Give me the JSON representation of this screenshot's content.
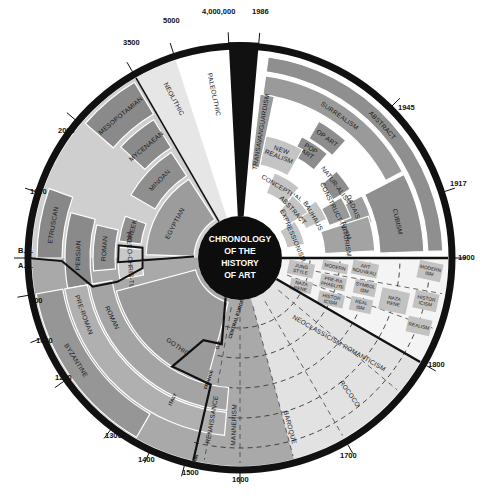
{
  "title": [
    "CHRONOLOGY",
    "OF THE",
    "HISTORY",
    "OF ART"
  ],
  "colors": {
    "ring": "#111111",
    "dark": "#8a8a8a",
    "mid": "#a8a8a8",
    "light": "#c8c8c8",
    "pale": "#dedede",
    "white": "#ffffff",
    "box": "#bdbdbd"
  },
  "geometry": {
    "cx": 240,
    "cy": 258,
    "r_outer": 216,
    "r_ring_inner": 208,
    "r_center": 42
  },
  "ticks": [
    {
      "label": "4,000,000",
      "angle": -3,
      "lx": 202,
      "ly": 14
    },
    {
      "label": "1986",
      "angle": 5,
      "lx": 252,
      "ly": 14
    },
    {
      "label": "5000",
      "angle": -18,
      "lx": 163,
      "ly": 23
    },
    {
      "label": "3500",
      "angle": -30,
      "lx": 123,
      "ly": 45
    },
    {
      "label": "2000",
      "angle": -50,
      "lx": 58,
      "ly": 133
    },
    {
      "label": "1000",
      "angle": -72,
      "lx": 30,
      "ly": 194
    },
    {
      "label": "B.C.",
      "angle": -90,
      "lx": 18,
      "ly": 253
    },
    {
      "label": "A.D.",
      "angle": -91,
      "lx": 18,
      "ly": 268
    },
    {
      "label": "500",
      "angle": -100,
      "lx": 30,
      "ly": 303
    },
    {
      "label": "1000",
      "angle": -112,
      "lx": 36,
      "ly": 343
    },
    {
      "label": "1200",
      "angle": -125,
      "lx": 55,
      "ly": 380
    },
    {
      "label": "1300",
      "angle": -143,
      "lx": 105,
      "ly": 438
    },
    {
      "label": "1400",
      "angle": -155,
      "lx": 138,
      "ly": 462
    },
    {
      "label": "1500",
      "angle": -165,
      "lx": 182,
      "ly": 475
    },
    {
      "label": "1600",
      "angle": 180,
      "lx": 232,
      "ly": 482
    },
    {
      "label": "1700",
      "angle": 150,
      "lx": 340,
      "ly": 458
    },
    {
      "label": "1800",
      "angle": 120,
      "lx": 428,
      "ly": 367
    },
    {
      "label": "1900",
      "angle": 90,
      "lx": 458,
      "ly": 260
    },
    {
      "label": "1917",
      "angle": 72,
      "lx": 450,
      "ly": 186
    },
    {
      "label": "1945",
      "angle": 45,
      "lx": 398,
      "ly": 110
    }
  ],
  "wedges": [
    {
      "name": "paleolithic-wedge",
      "a0": -18,
      "a1": -3,
      "r0": 42,
      "r1": 208,
      "fill": "#ffffff"
    },
    {
      "name": "neolithic-wedge",
      "a0": -30,
      "a1": -18,
      "r0": 42,
      "r1": 208,
      "fill": "#e6e6e6"
    },
    {
      "name": "modern-era-wedge",
      "a0": 5,
      "a1": 90,
      "r0": 42,
      "r1": 208,
      "fill": "#ffffff"
    },
    {
      "name": "nineteenth-century-wedge",
      "a0": 90,
      "a1": 120,
      "r0": 42,
      "r1": 208,
      "fill": "#f4f4f4"
    },
    {
      "name": "baroque-era-wedge",
      "a0": 120,
      "a1": 180,
      "r0": 42,
      "r1": 208,
      "fill": "#e2e2e2"
    },
    {
      "name": "renaissance-wedge",
      "a0": 180,
      "a1": 195,
      "r0": 42,
      "r1": 208,
      "fill": "#f6f6f6"
    },
    {
      "name": "ancient-wedge",
      "a0": -90,
      "a1": -30,
      "r0": 42,
      "r1": 208,
      "fill": "#cfcfcf"
    },
    {
      "name": "medieval-wedge",
      "a0": -195,
      "a1": -90,
      "r0": 42,
      "r1": 208,
      "fill": "#a9a9a9"
    },
    {
      "name": "black-divider-wedge",
      "a0": -3,
      "a1": 5,
      "r0": 42,
      "r1": 216,
      "fill": "#111111"
    }
  ],
  "bands": [
    {
      "name": "abstract-band",
      "a0": 8,
      "a1": 88,
      "r0": 188,
      "r1": 203,
      "fill": "#8f8f8f",
      "label": "ABSTRACT",
      "la": 47,
      "lr": 195,
      "size": 7
    },
    {
      "name": "surrealism-band",
      "a0": 8,
      "a1": 62,
      "r0": 165,
      "r1": 184,
      "fill": "#9a9a9a",
      "label": "SURREALISM",
      "la": 35,
      "lr": 174,
      "size": 7
    },
    {
      "name": "cubism-band",
      "a0": 63,
      "a1": 88,
      "r0": 140,
      "r1": 184,
      "fill": "#8f8f8f",
      "label": "CUBISM",
      "la": 77,
      "lr": 162,
      "size": 6.5
    },
    {
      "name": "dadaism-band",
      "a0": 63,
      "a1": 75,
      "r0": 110,
      "r1": 137,
      "fill": "#9d9d9d",
      "label": "DADAISM",
      "la": 67,
      "lr": 124,
      "size": 5.5
    },
    {
      "name": "futurism-band",
      "a0": 72,
      "a1": 87,
      "r0": 85,
      "r1": 135,
      "fill": "#a3a3a3",
      "label": "FUTURISM",
      "la": 80,
      "lr": 108,
      "size": 6
    },
    {
      "name": "op-art-band",
      "a0": 30,
      "a1": 42,
      "r0": 138,
      "r1": 158,
      "fill": "#8d8d8d",
      "label": "OP ART",
      "la": 36,
      "lr": 148,
      "size": 6
    },
    {
      "name": "pop-art-band",
      "a0": 27,
      "a1": 40,
      "r0": 115,
      "r1": 136,
      "fill": "#8d8d8d",
      "label": "POP ART",
      "la": 33,
      "lr": 125,
      "size": 6
    },
    {
      "name": "new-realism-band",
      "a0": 12,
      "a1": 30,
      "r0": 95,
      "r1": 125,
      "fill": "#c4c4c4",
      "label": "NEW REALISM",
      "la": 21,
      "lr": 110,
      "size": 6.5
    },
    {
      "name": "naturalism-band",
      "a0": 48,
      "a1": 58,
      "r0": 110,
      "r1": 130,
      "fill": "#8d8d8d",
      "label": "NATUR-ALISM",
      "la": 53,
      "lr": 120,
      "size": 4.5
    },
    {
      "name": "constructivism-band",
      "a0": 59,
      "a1": 70,
      "r0": 95,
      "r1": 118,
      "fill": "#999999",
      "label": "CONSTRUCT-IVISM",
      "la": 64,
      "lr": 106,
      "size": 4.5
    },
    {
      "name": "bauhaus-band",
      "a0": 53,
      "a1": 66,
      "r0": 72,
      "r1": 95,
      "fill": "#c4c4c4",
      "label": "BAUHAUS",
      "la": 60,
      "lr": 84,
      "size": 5
    },
    {
      "name": "conceptual-band",
      "a0": 22,
      "a1": 40,
      "r0": 70,
      "r1": 92,
      "fill": "#c4c4c4",
      "label": "CONCEPTUAL",
      "la": 31,
      "lr": 81,
      "size": 5
    },
    {
      "name": "abstract-inner-band",
      "a0": 40,
      "a1": 56,
      "r0": 60,
      "r1": 82,
      "fill": "#c4c4c4",
      "label": "ABSTRACT",
      "la": 48,
      "lr": 71,
      "size": 5
    },
    {
      "name": "expressionism-band",
      "a0": 56,
      "a1": 78,
      "r0": 48,
      "r1": 66,
      "fill": "#c4c4c4",
      "label": "EXPRESSIONISM",
      "la": 67,
      "lr": 57,
      "size": 4.8
    },
    {
      "name": "transavanguardism-band",
      "a0": 7,
      "a1": 12,
      "r0": 92,
      "r1": 165,
      "fill": "#9a9a9a",
      "label": "TRANSAVANGUARDISM",
      "la": 9.5,
      "lr": 128,
      "size": 5.5,
      "radial": true
    },
    {
      "name": "mesopotamian-band",
      "a0": -49,
      "a1": -31,
      "r0": 168,
      "r1": 205,
      "fill": "#8a8a8a",
      "label": "MESOPOTAMIAN",
      "la": -40,
      "lr": 186,
      "size": 6.5
    },
    {
      "name": "mycenaean-band",
      "a0": -47,
      "a1": -32,
      "r0": 130,
      "r1": 163,
      "fill": "#8a8a8a",
      "label": "MYCENAEAN",
      "la": -40,
      "lr": 146,
      "size": 6.5
    },
    {
      "name": "minoan-band",
      "a0": -60,
      "a1": -33,
      "r0": 98,
      "r1": 126,
      "fill": "#8f8f8f",
      "label": "MINOAN",
      "la": -46,
      "lr": 112,
      "size": 6.5
    },
    {
      "name": "egyptian-band",
      "a0": -88,
      "a1": -33,
      "r0": 46,
      "r1": 94,
      "fill": "#9c9c9c",
      "label": "EGYPTIAN",
      "la": -62,
      "lr": 74,
      "size": 7
    },
    {
      "name": "etruscan-band",
      "a0": -90,
      "a1": -70,
      "r0": 178,
      "r1": 203,
      "fill": "#888888",
      "label": "ETRUSCAN",
      "la": -80,
      "lr": 190,
      "size": 6.5
    },
    {
      "name": "persian-band",
      "a0": -100,
      "a1": -75,
      "r0": 150,
      "r1": 175,
      "fill": "#8a8a8a",
      "label": "PERSIAN",
      "la": -89,
      "lr": 162,
      "size": 6.5
    },
    {
      "name": "roman-ancient-band",
      "a0": -95,
      "a1": -77,
      "r0": 125,
      "r1": 147,
      "fill": "#8f8f8f",
      "label": "ROMAN",
      "la": -86,
      "lr": 136,
      "size": 6
    },
    {
      "name": "greek-band",
      "a0": -82,
      "a1": -70,
      "r0": 100,
      "r1": 122,
      "fill": "#8f8f8f",
      "label": "GREEK",
      "la": -76,
      "lr": 111,
      "size": 5.5
    },
    {
      "name": "paleo-christian-band",
      "a0": -100,
      "a1": -85,
      "r0": 98,
      "r1": 122,
      "fill": "#c9c9c9",
      "label": "PALEO-CHRIS-TIAN",
      "la": -93,
      "lr": 110,
      "size": 5.5
    },
    {
      "name": "byzantine-band",
      "a0": -150,
      "a1": -100,
      "r0": 180,
      "r1": 207,
      "fill": "#969696",
      "label": "BYZANTINE",
      "la": -122,
      "lr": 193,
      "size": 7
    },
    {
      "name": "pre-roman-band",
      "a0": -175,
      "a1": -100,
      "r0": 155,
      "r1": 178,
      "fill": "#b0b0b0",
      "label": "PRE-ROMAN",
      "la": -110,
      "lr": 166,
      "size": 6.5
    },
    {
      "name": "roman-medieval-band",
      "a0": -175,
      "a1": -100,
      "r0": 130,
      "r1": 153,
      "fill": "#a4a4a4",
      "label": "ROMAN",
      "la": -115,
      "lr": 141,
      "size": 6.5
    },
    {
      "name": "gothic-band",
      "a0": -165,
      "a1": -105,
      "r0": 46,
      "r1": 128,
      "fill": "#9a9a9a",
      "label": "GOTHIC",
      "la": -145,
      "lr": 108,
      "size": 7
    }
  ],
  "medieval_sublabels": [
    {
      "label": "CENTRAL EUROPE",
      "x": 238,
      "y": 318,
      "rot": -72
    },
    {
      "label": "G.B.",
      "x": 220,
      "y": 345,
      "rot": -72
    },
    {
      "label": "FRANCE",
      "x": 210,
      "y": 380,
      "rot": -72
    },
    {
      "label": "ITALY",
      "x": 174,
      "y": 400,
      "rot": -65
    },
    {
      "label": "SPAIN",
      "x": 196,
      "y": 462,
      "rot": -72
    }
  ],
  "nineteenth_boxes": [
    {
      "label": "JUNG STYLE",
      "x": 288,
      "y": 262,
      "w": 26,
      "h": 14
    },
    {
      "label": "MODERN",
      "x": 322,
      "y": 262,
      "w": 26,
      "h": 10
    },
    {
      "label": "ART NOUVEAU",
      "x": 352,
      "y": 262,
      "w": 26,
      "h": 14
    },
    {
      "label": "NAZA RENE",
      "x": 290,
      "y": 280,
      "w": 22,
      "h": 12
    },
    {
      "label": "PRE-RA PHAELITE",
      "x": 320,
      "y": 276,
      "w": 26,
      "h": 13
    },
    {
      "label": "SYMBOL ISM",
      "x": 354,
      "y": 281,
      "w": 22,
      "h": 14
    },
    {
      "label": "HISTOR ICISM",
      "x": 318,
      "y": 293,
      "w": 26,
      "h": 13
    },
    {
      "label": "REAL ISM",
      "x": 350,
      "y": 298,
      "w": 22,
      "h": 14
    },
    {
      "label": "NAZA RENE",
      "x": 380,
      "y": 290,
      "w": 28,
      "h": 22
    },
    {
      "label": "MODERN ISM",
      "x": 418,
      "y": 262,
      "w": 24,
      "h": 18
    },
    {
      "label": "HISTOR ICISM",
      "x": 414,
      "y": 292,
      "w": 24,
      "h": 18
    },
    {
      "label": "REALISM",
      "x": 407,
      "y": 318,
      "w": 24,
      "h": 16
    }
  ],
  "baroque_labels": [
    {
      "label": "NEOCLASSICISM ROMANTICISM",
      "x": 338,
      "y": 345,
      "rot": 30,
      "size": 7
    },
    {
      "label": "ROCOCO",
      "x": 348,
      "y": 395,
      "rot": 55,
      "size": 6.5
    },
    {
      "label": "BAROQUE",
      "x": 288,
      "y": 428,
      "rot": 75,
      "size": 6.5
    },
    {
      "label": "MANNERISM",
      "x": 236,
      "y": 425,
      "rot": -88,
      "size": 6.5
    },
    {
      "label": "RENAISSANCE",
      "x": 214,
      "y": 420,
      "rot": -80,
      "size": 6.5
    }
  ],
  "prehistoric_labels": [
    {
      "label": "PALEOLITHIC",
      "x": 212,
      "y": 95,
      "rot": 78,
      "size": 6.5
    },
    {
      "label": "NEOLITHIC",
      "x": 172,
      "y": 100,
      "rot": 62,
      "size": 6.5
    }
  ]
}
